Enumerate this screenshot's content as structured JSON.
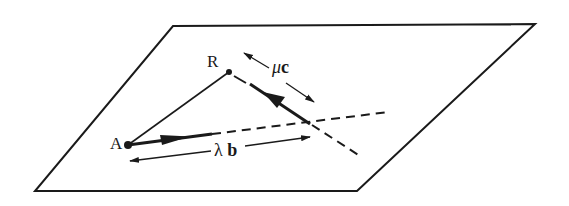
{
  "diagram": {
    "type": "vector-plane",
    "colors": {
      "ink": "#1a1a1a",
      "background": "#ffffff"
    },
    "plane": {
      "shape": "parallelogram",
      "corners": [
        [
          173,
          26
        ],
        [
          535,
          24
        ],
        [
          357,
          191
        ],
        [
          35,
          191
        ]
      ]
    },
    "points": [
      {
        "id": "A",
        "label": "A",
        "pos": [
          128,
          145
        ]
      },
      {
        "id": "R",
        "label": "R",
        "pos": [
          229,
          72
        ]
      }
    ],
    "lines": [
      {
        "id": "AR",
        "style": "solid",
        "from": "A",
        "to": "R"
      },
      {
        "id": "line-b",
        "style": "dashed",
        "from": [
          210,
          134
        ],
        "to": [
          388,
          112
        ]
      },
      {
        "id": "line-c",
        "style": "dashed",
        "from": [
          236,
          78
        ],
        "to": [
          360,
          156
        ]
      }
    ],
    "vectors": [
      {
        "id": "b",
        "style": "bold-arrow",
        "from": [
          128,
          145
        ],
        "to": [
          190,
          137
        ]
      },
      {
        "id": "c",
        "style": "bold-arrow",
        "from": [
          310,
          123
        ],
        "to": [
          266,
          93
        ]
      }
    ],
    "dimension_arrows": [
      {
        "id": "mu-c",
        "label_greek": "μ",
        "label_bold": "c",
        "label_pos": [
          274,
          62
        ]
      },
      {
        "id": "lambda-b",
        "label_greek": "λ",
        "label_bold": "b",
        "label_pos": [
          214,
          142
        ]
      }
    ],
    "labels": {
      "A": "A",
      "R": "R",
      "mu": "μ",
      "c": "c",
      "lambda": "λ",
      "b": "b"
    }
  }
}
